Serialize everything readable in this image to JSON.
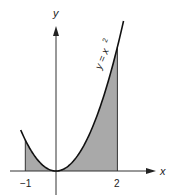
{
  "chart_data": {
    "type": "area",
    "title": "",
    "function": "y = x^2",
    "curve_label": "y = x²",
    "xlabel": "x",
    "ylabel": "y",
    "x_ticks": [
      -1,
      2
    ],
    "x_tick_labels": [
      "−1",
      "2"
    ],
    "shaded_interval": [
      -1,
      2
    ],
    "curve_domain": [
      -1.15,
      2.2
    ],
    "x": [
      -1,
      -0.5,
      0,
      0.5,
      1,
      1.5,
      2
    ],
    "values": [
      1,
      0.25,
      0,
      0.25,
      1,
      2.25,
      4
    ],
    "grid": false,
    "colors": {
      "shade": "#a9a9a9",
      "curve": "#111111",
      "axis": "#333333"
    }
  },
  "labels": {
    "x_axis": "x",
    "y_axis": "y",
    "curve": "y = x",
    "curve_exp": "2",
    "tick_neg1": "−1",
    "tick_2": "2"
  }
}
